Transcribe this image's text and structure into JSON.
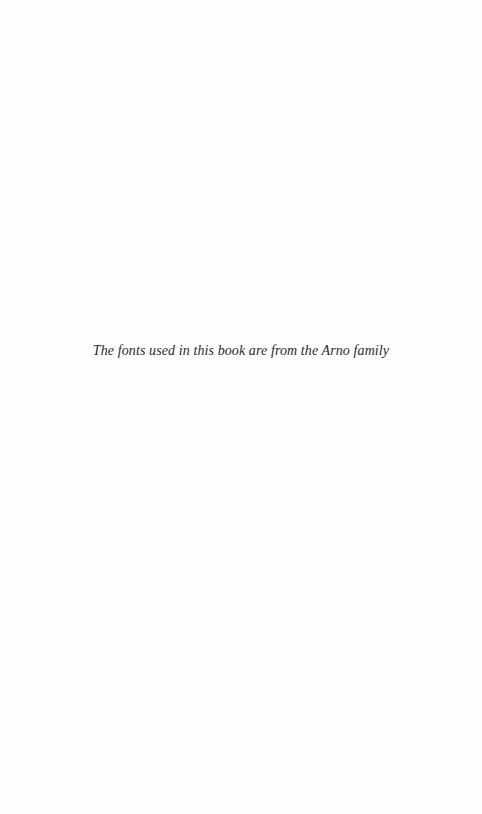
{
  "page": {
    "colophon_text": "The fonts used in this book are from the Arno family"
  }
}
